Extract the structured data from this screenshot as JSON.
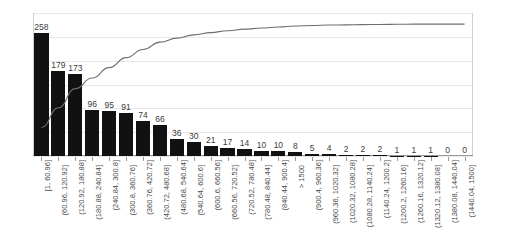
{
  "chart_data": {
    "type": "bar",
    "title": "",
    "subtitle": "",
    "xlabel": "",
    "ylabel": "",
    "grid": true,
    "legend": false,
    "ylim": [
      0,
      300
    ],
    "y2lim": [
      0,
      100
    ],
    "left_axis_ticks": [
      "300",
      "250",
      "200",
      "150",
      "100",
      "50",
      "0"
    ],
    "left_axis_tick_values": [
      300,
      250,
      200,
      150,
      100,
      50,
      0
    ],
    "right_axis_ticks": [
      "100%",
      "90%",
      "80%",
      "70%",
      "60%",
      "50%",
      "40%",
      "30%",
      "20%",
      "10%",
      "0%"
    ],
    "right_axis_tick_values": [
      100,
      90,
      80,
      70,
      60,
      50,
      40,
      30,
      20,
      10,
      0
    ],
    "categories": [
      "[1, 60.96]",
      "(60.96, 120.92]",
      "(120.92, 180.88]",
      "(180.88, 240.84]",
      "(240.84, 300.8]",
      "(300.8, 360.76]",
      "(360.76, 420.72]",
      "(420.72, 480.68]",
      "(480.68, 540.64]",
      "(540.64, 600.6]",
      "(600.6, 660.56]",
      "(660.56, 720.52]",
      "(720.52, 780.48]",
      "(780.48, 840.44]",
      "(840.44, 900.4]",
      "> 1500",
      "(900.4, 960.36]",
      "(960.36, 1020.32]",
      "(1020.32, 1080.28]",
      "(1080.28, 1140.24]",
      "(1140.24, 1200.2]",
      "(1200.2, 1260.16]",
      "(1260.16, 1320.12]",
      "(1320.12, 1380.08]",
      "(1380.08, 1440.04]",
      "(1440.04, 1500]"
    ],
    "values": [
      258,
      179,
      173,
      96,
      95,
      91,
      74,
      66,
      36,
      30,
      21,
      17,
      14,
      10,
      10,
      8,
      5,
      4,
      2,
      2,
      2,
      1,
      1,
      1,
      0,
      0
    ],
    "bar_labels": [
      "258",
      "179",
      "173",
      "96",
      "95",
      "91",
      "74",
      "66",
      "36",
      "30",
      "21",
      "17",
      "14",
      "10",
      "10",
      "8",
      "5",
      "4",
      "2",
      "2",
      "2",
      "1",
      "1",
      "1",
      "0",
      "0"
    ],
    "series": [
      {
        "name": "Frequency",
        "type": "bar",
        "axis": "left",
        "color": "#111111",
        "values": [
          258,
          179,
          173,
          96,
          95,
          91,
          74,
          66,
          36,
          30,
          21,
          17,
          14,
          10,
          10,
          8,
          5,
          4,
          2,
          2,
          2,
          1,
          1,
          1,
          0,
          0
        ]
      },
      {
        "name": "Cumulative %",
        "type": "line",
        "axis": "right",
        "color": "#6e6e6e",
        "values": [
          19.9,
          33.7,
          47.1,
          54.5,
          61.8,
          68.8,
          74.5,
          79.6,
          82.4,
          84.7,
          86.3,
          87.6,
          88.7,
          89.5,
          90.2,
          90.9,
          91.3,
          91.6,
          91.7,
          91.9,
          92.0,
          92.1,
          92.2,
          92.2,
          92.2,
          92.2
        ]
      }
    ],
    "line_color": "#6e6e6e",
    "bar_color": "#111111",
    "grid_color": "#e8e8e8",
    "axis_color": "#9a9a9a",
    "text_color": "#4a4a4a"
  }
}
